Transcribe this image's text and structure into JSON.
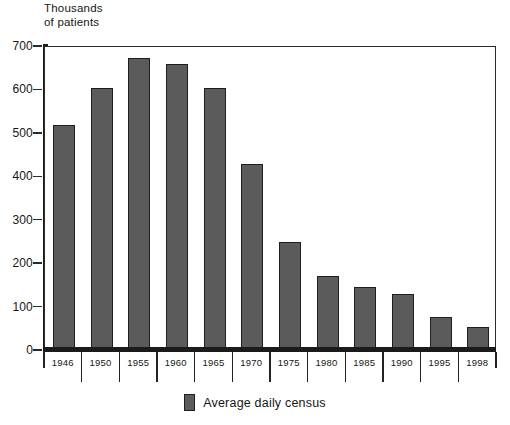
{
  "chart_data": {
    "type": "bar",
    "title": "",
    "subtitle": "",
    "xlabel": "",
    "ylabel": "Thousands\nof patients",
    "ylim": [
      0,
      700
    ],
    "ytick_step": 100,
    "yticks": [
      0,
      100,
      200,
      300,
      400,
      500,
      600,
      700
    ],
    "ytick_labels": [
      "0",
      "100",
      "200",
      "300",
      "400",
      "500",
      "600",
      "700"
    ],
    "grid": false,
    "legend_position": "bottom-center",
    "categories": [
      "1946",
      "1950",
      "1955",
      "1960",
      "1965",
      "1970",
      "1975",
      "1980",
      "1985",
      "1990",
      "1995",
      "1998"
    ],
    "series": [
      {
        "name": "Average daily census",
        "color": "#5B5B5B",
        "values": [
          520,
          605,
          675,
          662,
          605,
          430,
          250,
          172,
          147,
          131,
          78,
          55
        ]
      }
    ]
  },
  "legend": {
    "entries": [
      {
        "label": "Average daily census",
        "color": "#5B5B5B"
      }
    ]
  },
  "axes": {
    "y_title": "Thousands\nof patients",
    "bar_border_color": "#1E1E1E",
    "axis_color": "#1B1B1B"
  }
}
